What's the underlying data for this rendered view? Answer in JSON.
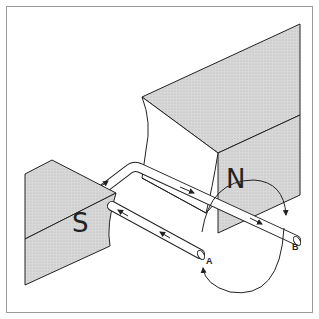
{
  "diagram": {
    "type": "generator-coil-between-magnets",
    "magnets": [
      {
        "pole": "N",
        "label": "N"
      },
      {
        "pole": "S",
        "label": "S"
      }
    ],
    "terminals": [
      {
        "id": "A",
        "label": "A"
      },
      {
        "id": "B",
        "label": "B"
      }
    ],
    "rotation_indicator": "curved-arrows-around-axis",
    "colors": {
      "outline": "#222222",
      "magnet_fill": "#d4d4d4",
      "frame": "#9a9a9a"
    }
  }
}
